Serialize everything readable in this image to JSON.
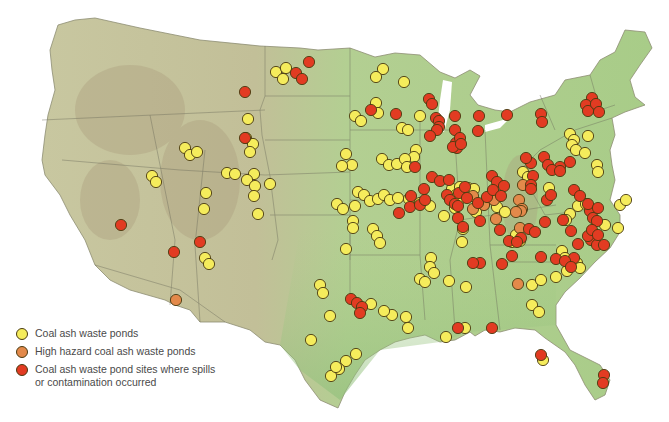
{
  "map": {
    "title": "Coal ash waste pond sites in the contiguous United States",
    "colors": {
      "land": "#b9c99a",
      "land_east": "#a9cf8a",
      "mountains": "#b8ac8c",
      "state_border": "#6b6b5a",
      "yellow": "#f5ec5c",
      "orange": "#e3894a",
      "red": "#e23b22",
      "dot_stroke": "#4a3a10"
    },
    "sites": {
      "coal_ash": [
        [
          276,
          72
        ],
        [
          286,
          68
        ],
        [
          283,
          79
        ],
        [
          248,
          119
        ],
        [
          246,
          138
        ],
        [
          253,
          144
        ],
        [
          250,
          152
        ],
        [
          185,
          148
        ],
        [
          190,
          155
        ],
        [
          197,
          152
        ],
        [
          152,
          176
        ],
        [
          156,
          182
        ],
        [
          227,
          173
        ],
        [
          235,
          174
        ],
        [
          254,
          174
        ],
        [
          247,
          180
        ],
        [
          255,
          186
        ],
        [
          254,
          196
        ],
        [
          270,
          184
        ],
        [
          206,
          193
        ],
        [
          204,
          209
        ],
        [
          258,
          214
        ],
        [
          205,
          258
        ],
        [
          209,
          264
        ],
        [
          320,
          285
        ],
        [
          323,
          293
        ],
        [
          383,
          69
        ],
        [
          376,
          77
        ],
        [
          404,
          82
        ],
        [
          376,
          103
        ],
        [
          378,
          113
        ],
        [
          355,
          116
        ],
        [
          361,
          121
        ],
        [
          420,
          116
        ],
        [
          402,
          128
        ],
        [
          408,
          130
        ],
        [
          416,
          150
        ],
        [
          414,
          157
        ],
        [
          346,
          154
        ],
        [
          352,
          165
        ],
        [
          382,
          159
        ],
        [
          389,
          165
        ],
        [
          397,
          164
        ],
        [
          405,
          159
        ],
        [
          407,
          167
        ],
        [
          355,
          206
        ],
        [
          342,
          166
        ],
        [
          337,
          204
        ],
        [
          343,
          209
        ],
        [
          358,
          192
        ],
        [
          364,
          195
        ],
        [
          370,
          201
        ],
        [
          378,
          199
        ],
        [
          384,
          195
        ],
        [
          390,
          200
        ],
        [
          398,
          198
        ],
        [
          409,
          199
        ],
        [
          420,
          203
        ],
        [
          430,
          206
        ],
        [
          444,
          216
        ],
        [
          452,
          189
        ],
        [
          456,
          195
        ],
        [
          460,
          187
        ],
        [
          468,
          188
        ],
        [
          474,
          189
        ],
        [
          460,
          199
        ],
        [
          476,
          212
        ],
        [
          484,
          204
        ],
        [
          497,
          207
        ],
        [
          505,
          212
        ],
        [
          455,
          208
        ],
        [
          523,
          172
        ],
        [
          528,
          177
        ],
        [
          549,
          188
        ],
        [
          570,
          134
        ],
        [
          574,
          140
        ],
        [
          572,
          145
        ],
        [
          576,
          150
        ],
        [
          585,
          153
        ],
        [
          588,
          136
        ],
        [
          597,
          165
        ],
        [
          598,
          172
        ],
        [
          570,
          214
        ],
        [
          566,
          220
        ],
        [
          578,
          206
        ],
        [
          586,
          204
        ],
        [
          605,
          225
        ],
        [
          618,
          228
        ],
        [
          620,
          205
        ],
        [
          626,
          200
        ],
        [
          512,
          242
        ],
        [
          516,
          235
        ],
        [
          520,
          241
        ],
        [
          562,
          251
        ],
        [
          565,
          258
        ],
        [
          556,
          277
        ],
        [
          567,
          271
        ],
        [
          577,
          263
        ],
        [
          580,
          268
        ],
        [
          532,
          285
        ],
        [
          541,
          280
        ],
        [
          532,
          305
        ],
        [
          346,
          249
        ],
        [
          353,
          221
        ],
        [
          353,
          228
        ],
        [
          373,
          229
        ],
        [
          377,
          236
        ],
        [
          380,
          243
        ],
        [
          420,
          279
        ],
        [
          425,
          282
        ],
        [
          449,
          281
        ],
        [
          466,
          287
        ],
        [
          462,
          242
        ],
        [
          463,
          229
        ],
        [
          431,
          258
        ],
        [
          430,
          267
        ],
        [
          434,
          273
        ],
        [
          371,
          304
        ],
        [
          392,
          315
        ],
        [
          408,
          328
        ],
        [
          446,
          337
        ],
        [
          465,
          328
        ],
        [
          356,
          354
        ],
        [
          346,
          361
        ],
        [
          339,
          369
        ],
        [
          331,
          376
        ],
        [
          311,
          340
        ],
        [
          330,
          316
        ],
        [
          384,
          311
        ],
        [
          406,
          317
        ],
        [
          539,
          312
        ],
        [
          543,
          360
        ],
        [
          336,
          367
        ]
      ],
      "high_hazard": [
        [
          176,
          300
        ],
        [
          473,
          196
        ],
        [
          484,
          205
        ],
        [
          473,
          209
        ],
        [
          494,
          200
        ],
        [
          523,
          185
        ],
        [
          519,
          200
        ],
        [
          496,
          219
        ],
        [
          522,
          209
        ],
        [
          521,
          211
        ],
        [
          516,
          212
        ],
        [
          520,
          228
        ],
        [
          518,
          284
        ]
      ],
      "contamination": [
        [
          245,
          92
        ],
        [
          296,
          73
        ],
        [
          302,
          79
        ],
        [
          309,
          62
        ],
        [
          245,
          138
        ],
        [
          121,
          225
        ],
        [
          174,
          252
        ],
        [
          200,
          242
        ],
        [
          371,
          110
        ],
        [
          396,
          114
        ],
        [
          429,
          99
        ],
        [
          432,
          104
        ],
        [
          436,
          118
        ],
        [
          439,
          121
        ],
        [
          439,
          127
        ],
        [
          437,
          130
        ],
        [
          430,
          136
        ],
        [
          455,
          116
        ],
        [
          455,
          130
        ],
        [
          457,
          148
        ],
        [
          456,
          143
        ],
        [
          453,
          147
        ],
        [
          460,
          138
        ],
        [
          461,
          144
        ],
        [
          479,
          116
        ],
        [
          478,
          131
        ],
        [
          507,
          115
        ],
        [
          541,
          114
        ],
        [
          542,
          122
        ],
        [
          570,
          162
        ],
        [
          592,
          98
        ],
        [
          586,
          105
        ],
        [
          588,
          111
        ],
        [
          596,
          104
        ],
        [
          599,
          112
        ],
        [
          560,
          167
        ],
        [
          531,
          163
        ],
        [
          533,
          176
        ],
        [
          526,
          158
        ],
        [
          544,
          157
        ],
        [
          548,
          165
        ],
        [
          552,
          170
        ],
        [
          560,
          171
        ],
        [
          531,
          185
        ],
        [
          531,
          189
        ],
        [
          547,
          200
        ],
        [
          551,
          195
        ],
        [
          574,
          190
        ],
        [
          580,
          196
        ],
        [
          590,
          211
        ],
        [
          588,
          204
        ],
        [
          593,
          218
        ],
        [
          598,
          208
        ],
        [
          415,
          167
        ],
        [
          432,
          177
        ],
        [
          424,
          189
        ],
        [
          440,
          181
        ],
        [
          449,
          180
        ],
        [
          447,
          195
        ],
        [
          450,
          200
        ],
        [
          455,
          204
        ],
        [
          459,
          193
        ],
        [
          465,
          187
        ],
        [
          492,
          176
        ],
        [
          497,
          182
        ],
        [
          504,
          186
        ],
        [
          467,
          198
        ],
        [
          478,
          203
        ],
        [
          487,
          197
        ],
        [
          493,
          190
        ],
        [
          501,
          196
        ],
        [
          458,
          206
        ],
        [
          521,
          238
        ],
        [
          529,
          229
        ],
        [
          545,
          222
        ],
        [
          563,
          220
        ],
        [
          571,
          231
        ],
        [
          578,
          244
        ],
        [
          574,
          258
        ],
        [
          591,
          240
        ],
        [
          597,
          221
        ],
        [
          597,
          245
        ],
        [
          604,
          245
        ],
        [
          588,
          236
        ],
        [
          535,
          232
        ],
        [
          592,
          230
        ],
        [
          598,
          235
        ],
        [
          458,
          218
        ],
        [
          463,
          227
        ],
        [
          410,
          207
        ],
        [
          420,
          205
        ],
        [
          425,
          200
        ],
        [
          411,
          196
        ],
        [
          399,
          213
        ],
        [
          480,
          221
        ],
        [
          500,
          230
        ],
        [
          509,
          241
        ],
        [
          517,
          242
        ],
        [
          512,
          256
        ],
        [
          541,
          257
        ],
        [
          556,
          259
        ],
        [
          565,
          261
        ],
        [
          571,
          267
        ],
        [
          480,
          263
        ],
        [
          473,
          263
        ],
        [
          502,
          264
        ],
        [
          351,
          299
        ],
        [
          357,
          303
        ],
        [
          362,
          307
        ],
        [
          360,
          313
        ],
        [
          458,
          328
        ],
        [
          492,
          328
        ],
        [
          541,
          355
        ],
        [
          604,
          375
        ],
        [
          603,
          383
        ]
      ]
    }
  },
  "legend": {
    "items": [
      {
        "label": "Coal ash waste ponds",
        "color": "#f5ec5c"
      },
      {
        "label": "High hazard coal ash waste ponds",
        "color": "#e3894a"
      },
      {
        "label": "Coal ash waste pond sites where spills or contamination occurred",
        "color": "#e23b22"
      }
    ]
  }
}
